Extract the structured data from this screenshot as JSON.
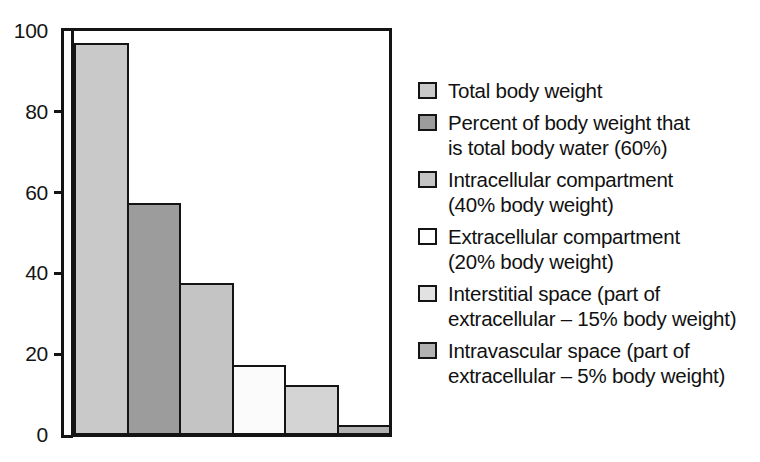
{
  "chart_data": {
    "type": "bar",
    "title": "",
    "subtitle": "",
    "xlabel": "",
    "ylabel": "",
    "ylim": [
      0,
      100
    ],
    "yticks": [
      0,
      20,
      40,
      60,
      80,
      100
    ],
    "grid": false,
    "legend_position": "right",
    "categories": [
      "Total body weight",
      "Percent of body weight that is total body water (60%)",
      "Intracellular compartment (40% body weight)",
      "Extracellular compartment (20% body weight)",
      "Interstitial space (part of extracellular – 15% body weight)",
      "Intravascular space (part of extracellular – 5% body weight)"
    ],
    "values": [
      97,
      57.5,
      37.5,
      17.3,
      12.3,
      2.5
    ],
    "colors": [
      "#c9c9c9",
      "#9c9c9c",
      "#c4c4c4",
      "#fbfbfb",
      "#d4d4d4",
      "#b2b2b2"
    ],
    "bar_edge_color": "#141414",
    "axis_color": "#141414",
    "background": "#ffffff"
  },
  "axis": {
    "y_tick_labels": [
      "100",
      "80",
      "60",
      "40",
      "20",
      "0"
    ]
  },
  "legend": {
    "items": [
      {
        "label": "Total body weight",
        "color": "#c9c9c9"
      },
      {
        "label": "Percent of body weight that\nis total body water (60%)",
        "color": "#9c9c9c"
      },
      {
        "label": "Intracellular compartment\n(40% body weight)",
        "color": "#c4c4c4"
      },
      {
        "label": "Extracellular compartment\n(20% body weight)",
        "color": "#ffffff"
      },
      {
        "label": "Interstitial space (part of\nextracellular – 15% body weight)",
        "color": "#e2e2e2"
      },
      {
        "label": "Intravascular space (part of\nextracellular – 5% body weight)",
        "color": "#b2b2b2"
      }
    ]
  }
}
